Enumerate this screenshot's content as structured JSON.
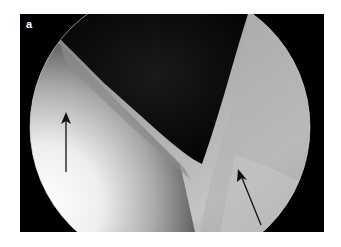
{
  "figure": {
    "panel_label": "a",
    "annotations": [
      {
        "type": "arrow",
        "name": "left-arrow",
        "direction": "up"
      },
      {
        "type": "arrow",
        "name": "right-arrow",
        "direction": "up-left"
      }
    ],
    "colors": {
      "frame_background": "#000000",
      "cavity": "#0c0c0c",
      "tissue_bright": "#f4f4f4",
      "tissue_mid": "#b8b8b8",
      "tissue_dark": "#6a6a6a",
      "arrow": "#111111",
      "label": "#ffffff"
    }
  }
}
